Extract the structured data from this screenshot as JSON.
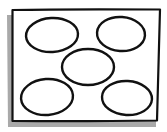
{
  "diagram": {
    "stroke_color": "#111111",
    "shadow_color": "#9a9a9a",
    "background_color": "#ffffff",
    "shapes": [
      {
        "name": "ellipse-top-left",
        "position": "top-left"
      },
      {
        "name": "ellipse-top-right",
        "position": "top-right"
      },
      {
        "name": "ellipse-center",
        "position": "center"
      },
      {
        "name": "ellipse-bottom-left",
        "position": "bottom-left"
      },
      {
        "name": "ellipse-bottom-right",
        "position": "bottom-right"
      }
    ]
  }
}
